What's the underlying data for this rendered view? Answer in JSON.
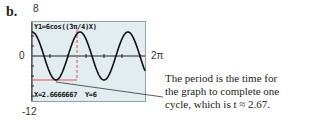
{
  "part_label": "b.",
  "window": {
    "ymax_label": "8",
    "ymin_label": "-12",
    "xmin_label": "0",
    "xmax_label": "2π"
  },
  "screen": {
    "equation": "Y1=6cos((3π/4)X)",
    "status": "X=2.6666667  Y=6"
  },
  "caption": "The period is the time for the graph to complete one cycle, which is t ≈ 2.67.",
  "colors": {
    "screen_bg": "#e3ecee",
    "curve": "#111111",
    "trace": "#d9534f"
  },
  "chart_data": {
    "type": "line",
    "title": "Y1=6cos((3π/4)X)",
    "function": "y = 6cos(3πx/4)",
    "xlabel": "t",
    "ylabel": "y",
    "xlim": [
      0,
      6.2832
    ],
    "ylim": [
      -12,
      8
    ],
    "tick_labels": {
      "x": [
        "0",
        "2π"
      ],
      "y": [
        "8",
        "0",
        "-12"
      ]
    },
    "amplitude": 6,
    "period": 2.6666667,
    "trace_point": {
      "x": 2.6666667,
      "y": 6
    },
    "annotation": "The period is the time for the graph to complete one cycle, which is t ≈ 2.67.",
    "grid": false
  }
}
